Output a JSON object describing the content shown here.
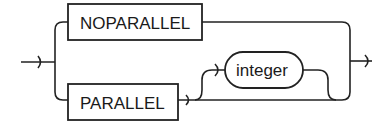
{
  "diagram": {
    "type": "railroad-syntax-diagram",
    "keywords": [
      {
        "label": "NOPARALLEL",
        "shape": "rectangle"
      },
      {
        "label": "PARALLEL",
        "shape": "rectangle"
      }
    ],
    "parameters": [
      {
        "label": "integer",
        "shape": "rounded",
        "optional": true,
        "follows": "PARALLEL"
      }
    ],
    "paths": [
      "entry -> NOPARALLEL -> exit",
      "entry -> PARALLEL -> exit",
      "entry -> PARALLEL -> integer -> exit"
    ]
  }
}
